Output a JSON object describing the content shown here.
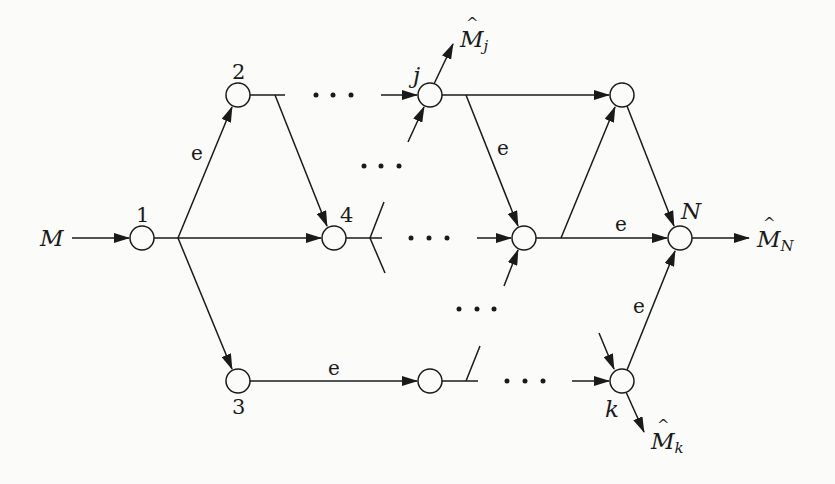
{
  "diagram": {
    "type": "directed-network",
    "source_label": "M",
    "nodes": [
      {
        "id": "1",
        "label": "1",
        "x": 142,
        "y": 238
      },
      {
        "id": "2",
        "label": "2",
        "x": 238,
        "y": 95
      },
      {
        "id": "3",
        "label": "3",
        "x": 238,
        "y": 381
      },
      {
        "id": "4",
        "label": "4",
        "x": 334,
        "y": 238
      },
      {
        "id": "j",
        "label": "j",
        "x": 430,
        "y": 95
      },
      {
        "id": "m",
        "label": "",
        "x": 524,
        "y": 238
      },
      {
        "id": "t",
        "label": "",
        "x": 622,
        "y": 95
      },
      {
        "id": "b",
        "label": "",
        "x": 430,
        "y": 381
      },
      {
        "id": "N",
        "label": "N",
        "x": 680,
        "y": 238
      },
      {
        "id": "k",
        "label": "k",
        "x": 622,
        "y": 381
      }
    ],
    "edge_label": "e",
    "outputs": {
      "j": {
        "base": "M",
        "sub": "j"
      },
      "N": {
        "base": "M",
        "sub": "N"
      },
      "k": {
        "base": "M",
        "sub": "k"
      }
    },
    "ellipsis": "• • •"
  }
}
